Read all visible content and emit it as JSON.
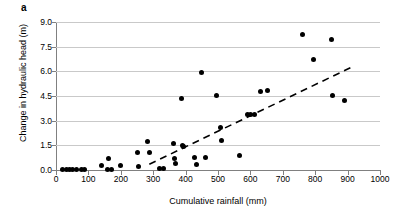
{
  "figure": {
    "panel_label": "a",
    "background_color": "#ffffff",
    "marker_color": "#000000",
    "gridline_color": "#c9c9c9",
    "axis_color": "#808080"
  },
  "chart_data": {
    "type": "scatter",
    "title": "",
    "xlabel": "Cumulative rainfall (mm)",
    "ylabel": "Change in hydraulic head (m)",
    "xlim": [
      0,
      1000
    ],
    "ylim": [
      0.0,
      9.0
    ],
    "xticks": [
      0,
      100,
      200,
      300,
      400,
      500,
      600,
      700,
      800,
      900,
      1000
    ],
    "xtick_labels": [
      "0",
      "100",
      "200",
      "300",
      "400",
      "500",
      "600",
      "700",
      "800",
      "900",
      "1000"
    ],
    "yticks": [
      0.0,
      1.5,
      3.0,
      4.5,
      6.0,
      7.5,
      9.0
    ],
    "ytick_labels": [
      "0.0",
      "1.5",
      "3.0",
      "4.5",
      "6.0",
      "7.5",
      "9.0"
    ],
    "grid": "horizontal",
    "legend": "none",
    "points": [
      {
        "x": 20,
        "y": 0.02
      },
      {
        "x": 32,
        "y": 0.02
      },
      {
        "x": 42,
        "y": 0.02
      },
      {
        "x": 52,
        "y": 0.02
      },
      {
        "x": 62,
        "y": 0.02
      },
      {
        "x": 78,
        "y": 0.02
      },
      {
        "x": 88,
        "y": 0.02
      },
      {
        "x": 140,
        "y": 0.3
      },
      {
        "x": 162,
        "y": 0.7
      },
      {
        "x": 160,
        "y": 0.05
      },
      {
        "x": 170,
        "y": 0.05
      },
      {
        "x": 200,
        "y": 0.25
      },
      {
        "x": 252,
        "y": 1.05
      },
      {
        "x": 256,
        "y": 0.22
      },
      {
        "x": 283,
        "y": 1.75
      },
      {
        "x": 288,
        "y": 1.05
      },
      {
        "x": 320,
        "y": 0.1
      },
      {
        "x": 332,
        "y": 0.08
      },
      {
        "x": 363,
        "y": 1.62
      },
      {
        "x": 366,
        "y": 0.7
      },
      {
        "x": 370,
        "y": 0.4
      },
      {
        "x": 388,
        "y": 4.35
      },
      {
        "x": 389,
        "y": 1.5
      },
      {
        "x": 392,
        "y": 1.45
      },
      {
        "x": 428,
        "y": 0.75
      },
      {
        "x": 433,
        "y": 0.35
      },
      {
        "x": 448,
        "y": 5.95
      },
      {
        "x": 462,
        "y": 0.78
      },
      {
        "x": 495,
        "y": 4.55
      },
      {
        "x": 508,
        "y": 2.6
      },
      {
        "x": 512,
        "y": 1.8
      },
      {
        "x": 567,
        "y": 0.9
      },
      {
        "x": 592,
        "y": 3.35
      },
      {
        "x": 600,
        "y": 3.4
      },
      {
        "x": 613,
        "y": 3.38
      },
      {
        "x": 632,
        "y": 4.75
      },
      {
        "x": 652,
        "y": 4.85
      },
      {
        "x": 762,
        "y": 8.25
      },
      {
        "x": 795,
        "y": 6.75
      },
      {
        "x": 851,
        "y": 7.95
      },
      {
        "x": 853,
        "y": 4.55
      },
      {
        "x": 891,
        "y": 4.25
      }
    ],
    "trendline": {
      "style": "dashed",
      "x_start": 288,
      "y_start": 0.35,
      "x_end": 912,
      "y_end": 6.25
    }
  }
}
